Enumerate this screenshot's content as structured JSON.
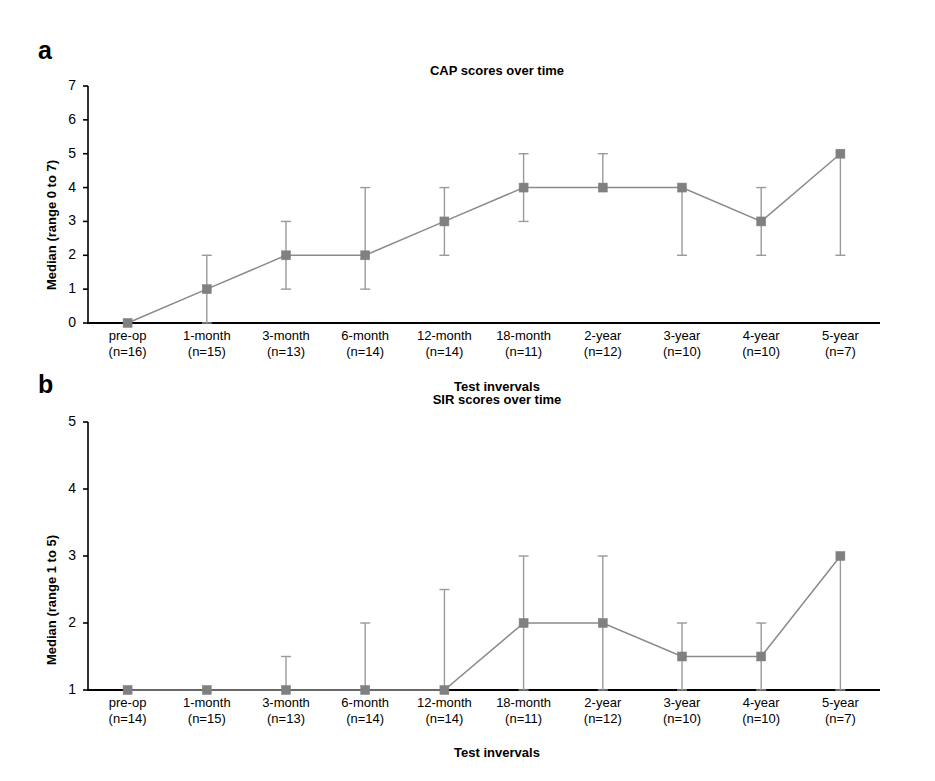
{
  "figure": {
    "panels": [
      {
        "letter": "a",
        "title": "CAP scores over time",
        "ylabel": "Median (range 0 to 7)",
        "xlabel": "Test invervals"
      },
      {
        "letter": "b",
        "title": "SIR scores over time",
        "ylabel": "Median (range 1 to 5)",
        "xlabel": "Test invervals"
      }
    ]
  },
  "colors": {
    "marker": "#808080",
    "line": "#8a8a8a",
    "errorbar": "#9a9a9a",
    "axis": "#000000",
    "text": "#000000"
  },
  "chart_data": [
    {
      "type": "line",
      "title": "CAP scores over time",
      "xlabel": "Test invervals",
      "ylabel": "Median (range 0 to 7)",
      "ylim": [
        0,
        7
      ],
      "yticks": [
        0,
        1,
        2,
        3,
        4,
        5,
        6,
        7
      ],
      "ytick_labels": [
        "0",
        "1",
        "2",
        "3",
        "4",
        "5",
        "6",
        "7"
      ],
      "grid": false,
      "legend": "none",
      "categories": [
        "pre-op",
        "1-month",
        "3-month",
        "6-month",
        "12-month",
        "18-month",
        "2-year",
        "3-year",
        "4-year",
        "5-year"
      ],
      "n_labels": [
        "(n=16)",
        "(n=15)",
        "(n=13)",
        "(n=14)",
        "(n=14)",
        "(n=11)",
        "(n=12)",
        "(n=10)",
        "(n=10)",
        "(n=7)"
      ],
      "values": [
        0,
        1,
        2,
        2,
        3,
        4,
        4,
        4,
        3,
        5
      ],
      "error_low": [
        0,
        0,
        1,
        1,
        2,
        3,
        4,
        2,
        2,
        2
      ],
      "error_high": [
        0,
        2,
        3,
        4,
        4,
        5,
        5,
        4,
        4,
        5
      ]
    },
    {
      "type": "line",
      "title": "SIR scores over time",
      "xlabel": "Test invervals",
      "ylabel": "Median (range 1 to 5)",
      "ylim": [
        1,
        5
      ],
      "yticks": [
        1,
        2,
        3,
        4,
        5
      ],
      "ytick_labels": [
        "1",
        "2",
        "3",
        "4",
        "5"
      ],
      "grid": false,
      "legend": "none",
      "categories": [
        "pre-op",
        "1-month",
        "3-month",
        "6-month",
        "12-month",
        "18-month",
        "2-year",
        "3-year",
        "4-year",
        "5-year"
      ],
      "n_labels": [
        "(n=14)",
        "(n=15)",
        "(n=13)",
        "(n=14)",
        "(n=14)",
        "(n=11)",
        "(n=12)",
        "(n=10)",
        "(n=10)",
        "(n=7)"
      ],
      "values": [
        1,
        1,
        1,
        1,
        1,
        2,
        2,
        1.5,
        1.5,
        3
      ],
      "error_low": [
        1,
        1,
        1,
        1,
        1,
        1,
        1,
        1,
        1,
        1
      ],
      "error_high": [
        1,
        1,
        1.5,
        2,
        2.5,
        3,
        3,
        2,
        2,
        3
      ]
    }
  ]
}
